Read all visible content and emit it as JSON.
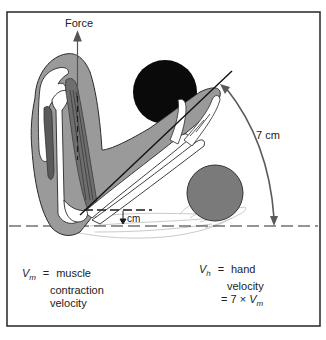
{
  "diagram": {
    "labels": {
      "force": "Force",
      "arc_distance": "7 cm",
      "muscle_distance": "cm",
      "vm_symbol": "V",
      "vm_subscript": "m",
      "vm_equals": "=",
      "vm_line1": "muscle",
      "vm_line2": "contraction",
      "vm_line3": "velocity",
      "vh_symbol": "V",
      "vh_subscript": "h",
      "vh_equals": "=",
      "vh_line1": "hand",
      "vh_line2": "velocity",
      "vh_line3_prefix": "= 7 × ",
      "vh_line3_symbol": "V",
      "vh_line3_subscript": "m"
    },
    "colors": {
      "frame": "#333333",
      "arm_fill": "#9a9a9a",
      "arm_outline": "#2a2a2a",
      "bone": "#ffffff",
      "muscle": "#555555",
      "black_ball": "#0a0a0a",
      "gray_ball": "#7a7a7a",
      "arrow": "#6a6a6a",
      "ghost_arm": "#c8c8c8"
    },
    "elements": {
      "black_ball": {
        "cx": 165,
        "cy": 92,
        "r": 32
      },
      "gray_ball": {
        "cx": 215,
        "cy": 193,
        "r": 28
      },
      "lever_line": {
        "x1": 80,
        "y1": 215,
        "x2": 232,
        "y2": 71
      },
      "horizontal_dashed_line_y": 226,
      "muscle_dashed_line_y": 210
    }
  }
}
